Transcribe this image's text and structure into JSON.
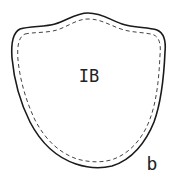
{
  "figure": {
    "region_label": "IB",
    "panel_label": "b",
    "colors": {
      "background": "#ffffff",
      "outline": "#1a1a1a",
      "inner_outline": "#444444",
      "text": "#222222"
    },
    "outlines": [
      {
        "name": "outer",
        "style": "solid"
      },
      {
        "name": "inner",
        "style": "dashed"
      }
    ]
  }
}
